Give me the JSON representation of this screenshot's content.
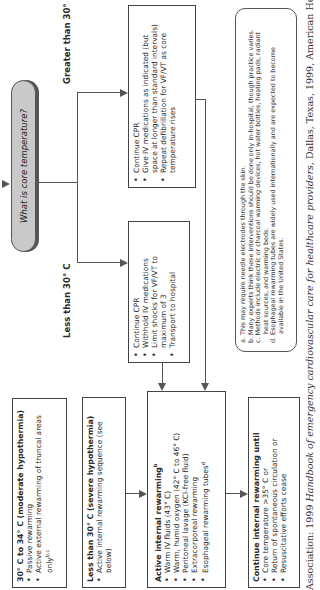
{
  "decision": {
    "question": "What is core temperature?"
  },
  "branches": {
    "greater": {
      "label": "Greater than 30° C",
      "items": [
        "Continue CPR",
        "Give IV medications as indicated (but space at longer than standard intervals)",
        "Repeat defibrillation for VF/VT as core temperature rises"
      ]
    },
    "less": {
      "label": "Less than 30° C",
      "items": [
        "Continue CPR",
        "Withhold IV medications",
        "Limit shocks for VF/VT to maximum of 3",
        "Transport to hospital"
      ]
    }
  },
  "moderate": {
    "title": "30° C to 34° C (moderate hypothermia)",
    "items": [
      "Passive rewarming",
      "Active external rewarming of truncal areas only"
    ],
    "items_sup": [
      "",
      "b,c"
    ]
  },
  "severe": {
    "title": "Less than 30° C (severe hypothermia)",
    "items": [
      "Active internal rewarming sequence (see below)"
    ]
  },
  "active_internal": {
    "title": "Active internal rewarming",
    "title_sup": "b",
    "items": [
      "Warm IV fluids (43° C)",
      "Warm, humid oxygen (42° C to 46° C)",
      "Peritoneal lavage (KCl-free fluid)",
      "Extracorporeal rewarming",
      "Esophageal rewarming tubes"
    ],
    "item4_sup": "d"
  },
  "continue_until": {
    "title": "Continue internal rewarming until",
    "items": [
      "Core temperature >35° C or",
      "Return of spontaneous circulation or",
      "Resuscitative efforts cease"
    ]
  },
  "footnotes": [
    "a. This may require needle electrodes through the skin.",
    "b. Many experts think these interventions should be done only in-hospital, though practice varies.",
    "c. Methods include electric or charcoal warming devices, hot water bottles, heating pads, radiant heat sources, and warming beds.",
    "d. Esophageal rewarming tubes are widely used internationally and are expected to become available in the United States."
  ],
  "citation": {
    "prefix": "Association: 1999 ",
    "title": "Handbook of emergency cardiovascular care for healthcare providers,",
    "suffix": " Dallas, Texas, 1999, American Heart"
  },
  "colors": {
    "line": "#555555",
    "oval_fill": "#c9c9c9",
    "text": "#2b2b2b"
  }
}
